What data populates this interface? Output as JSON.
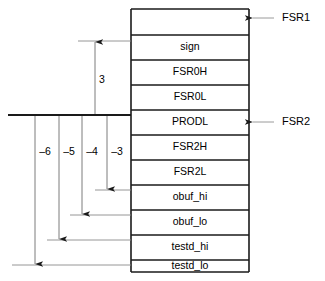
{
  "diagram": {
    "stack_cells": [
      {
        "label": "",
        "empty": true
      },
      {
        "label": "sign",
        "empty": false
      },
      {
        "label": "FSR0H",
        "empty": false
      },
      {
        "label": "FSR0L",
        "empty": false
      },
      {
        "label": "PRODL",
        "empty": false
      },
      {
        "label": "FSR2H",
        "empty": false
      },
      {
        "label": "FSR2L",
        "empty": false
      },
      {
        "label": "obuf_hi",
        "empty": false
      },
      {
        "label": "obuf_lo",
        "empty": false
      },
      {
        "label": "testd_hi",
        "empty": false
      },
      {
        "label": "testd_lo",
        "empty": false
      }
    ],
    "pointers": [
      {
        "name": "FSR1",
        "target_cell": "top-of-stack"
      },
      {
        "name": "FSR2",
        "target_cell": "PRODL"
      }
    ],
    "offsets": [
      {
        "label": "3",
        "direction": "up",
        "target_cell": "sign"
      },
      {
        "label": "–3",
        "direction": "down",
        "target_cell": "obuf_hi"
      },
      {
        "label": "–4",
        "direction": "down",
        "target_cell": "obuf_lo"
      },
      {
        "label": "–5",
        "direction": "down",
        "target_cell": "testd_hi"
      },
      {
        "label": "–6",
        "direction": "down",
        "target_cell": "testd_lo"
      }
    ],
    "colors": {
      "stroke": "#1a1a1a",
      "leader": "#8a8a8a",
      "background": "#ffffff",
      "text": "#000000"
    }
  }
}
